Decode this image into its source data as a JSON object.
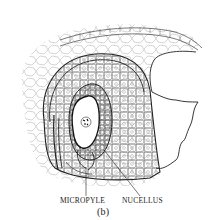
{
  "figure": {
    "labels": {
      "micropyle": "MICROPYLE",
      "nucellus": "NUCELLUS"
    },
    "caption": "(b)"
  },
  "colors": {
    "ink": "#222222",
    "light_ink": "#8a8a8a",
    "background": "#ffffff"
  }
}
